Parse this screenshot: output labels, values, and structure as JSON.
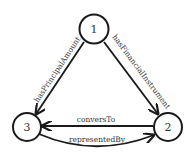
{
  "diagram": {
    "nodes": [
      {
        "id": "1",
        "label": "1"
      },
      {
        "id": "2",
        "label": "2"
      },
      {
        "id": "3",
        "label": "3"
      }
    ],
    "edges": [
      {
        "from": "1",
        "to": "3",
        "label": "hasPrincipalAmount"
      },
      {
        "from": "1",
        "to": "2",
        "label": "hasFinancialInstrument"
      },
      {
        "from": "2",
        "to": "3",
        "label": "conversTo"
      },
      {
        "from": "3",
        "to": "2",
        "label": "representedBy"
      }
    ],
    "colors": {
      "stroke": "#1a1a1a",
      "text": "#333333",
      "background": "#ffffff"
    }
  }
}
